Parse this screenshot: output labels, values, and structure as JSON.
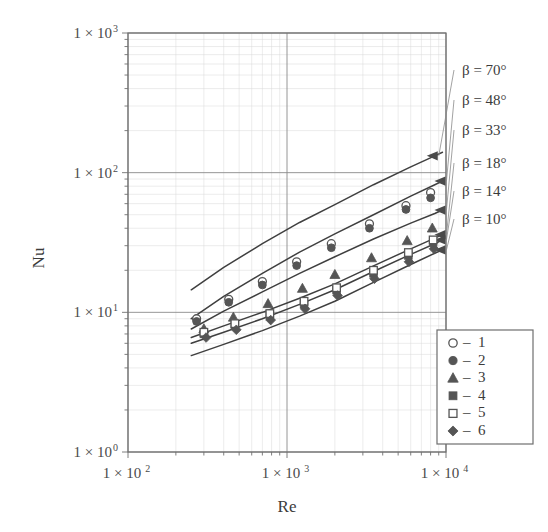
{
  "chart_data": {
    "type": "line",
    "title": "",
    "xlabel": "Re",
    "ylabel": "Nu",
    "xscale": "log",
    "yscale": "log",
    "xlim": [
      100,
      10000
    ],
    "ylim": [
      1,
      1000
    ],
    "grid": true,
    "x_tick_labels": [
      "1 × 10",
      "1 × 10",
      "1 × 10"
    ],
    "x_ticks": [
      {
        "value": 100,
        "mantissa": "1 × 10",
        "exponent": "2"
      },
      {
        "value": 1000,
        "mantissa": "1 × 10",
        "exponent": "3"
      },
      {
        "value": 10000,
        "mantissa": "1 × 10",
        "exponent": "4"
      }
    ],
    "y_ticks": [
      {
        "value": 1000,
        "mantissa": "1 × 10",
        "exponent": "3"
      },
      {
        "value": 100,
        "mantissa": "1 × 10",
        "exponent": "2"
      },
      {
        "value": 10,
        "mantissa": "1 × 10",
        "exponent": "1"
      },
      {
        "value": 1,
        "mantissa": "1 × 10",
        "exponent": "0"
      }
    ],
    "annotations": [
      {
        "label": "β = 70°",
        "beta": 70,
        "x": 462,
        "y": 75
      },
      {
        "label": "β = 48°",
        "beta": 48,
        "x": 462,
        "y": 105
      },
      {
        "label": "β = 33°",
        "beta": 33,
        "x": 462,
        "y": 135
      },
      {
        "label": "β = 18°",
        "beta": 18,
        "x": 462,
        "y": 168
      },
      {
        "label": "β = 14°",
        "beta": 14,
        "x": 462,
        "y": 196
      },
      {
        "label": "β = 10°",
        "beta": 10,
        "x": 462,
        "y": 224
      }
    ],
    "legend": {
      "position": "bottom-right",
      "entries": [
        {
          "marker": "open-circle",
          "dash": "–",
          "label": "1"
        },
        {
          "marker": "filled-circle",
          "dash": "–",
          "label": "2"
        },
        {
          "marker": "filled-triangle",
          "dash": "–",
          "label": "3"
        },
        {
          "marker": "filled-square",
          "dash": "–",
          "label": "4"
        },
        {
          "marker": "open-square",
          "dash": "–",
          "label": "5"
        },
        {
          "marker": "filled-diamond",
          "dash": "–",
          "label": "6"
        }
      ]
    },
    "curves": [
      {
        "name": "beta-70",
        "beta": 70,
        "points": [
          [
            250,
            14.5
          ],
          [
            400,
            21
          ],
          [
            700,
            31
          ],
          [
            1200,
            44
          ],
          [
            2000,
            59
          ],
          [
            3500,
            82
          ],
          [
            6000,
            110
          ],
          [
            8500,
            132
          ],
          [
            9500,
            140
          ]
        ]
      },
      {
        "name": "beta-48",
        "beta": 48,
        "points": [
          [
            250,
            9.0
          ],
          [
            400,
            13.0
          ],
          [
            700,
            19.0
          ],
          [
            1200,
            27.0
          ],
          [
            2000,
            36.5
          ],
          [
            3500,
            50
          ],
          [
            6000,
            68
          ],
          [
            8500,
            82
          ],
          [
            9500,
            87
          ]
        ]
      },
      {
        "name": "beta-33",
        "beta": 33,
        "points": [
          [
            250,
            7.6
          ],
          [
            400,
            10.2
          ],
          [
            700,
            14.0
          ],
          [
            1200,
            19.0
          ],
          [
            2000,
            25.0
          ],
          [
            3500,
            33.5
          ],
          [
            6000,
            43.5
          ],
          [
            8500,
            51
          ],
          [
            9500,
            54
          ]
        ]
      },
      {
        "name": "beta-18",
        "beta": 18,
        "points": [
          [
            250,
            6.6
          ],
          [
            400,
            8.0
          ],
          [
            700,
            10.0
          ],
          [
            1200,
            12.6
          ],
          [
            2000,
            16.0
          ],
          [
            3500,
            21.5
          ],
          [
            6000,
            28.5
          ],
          [
            8500,
            34
          ],
          [
            9500,
            36
          ]
        ]
      },
      {
        "name": "beta-14",
        "beta": 14,
        "points": [
          [
            250,
            6.0
          ],
          [
            400,
            7.2
          ],
          [
            700,
            9.0
          ],
          [
            1200,
            11.4
          ],
          [
            2000,
            14.5
          ],
          [
            3500,
            19.6
          ],
          [
            6000,
            26.0
          ],
          [
            8500,
            31
          ],
          [
            9500,
            33
          ]
        ]
      },
      {
        "name": "beta-10",
        "beta": 10,
        "points": [
          [
            250,
            4.9
          ],
          [
            400,
            5.9
          ],
          [
            700,
            7.4
          ],
          [
            1200,
            9.4
          ],
          [
            2000,
            12.0
          ],
          [
            3500,
            16.4
          ],
          [
            6000,
            22.0
          ],
          [
            8500,
            26.5
          ],
          [
            9500,
            28
          ]
        ]
      }
    ],
    "series": [
      {
        "name": "1",
        "marker": "open-circle",
        "points": [
          [
            270,
            9.0
          ],
          [
            430,
            12.4
          ],
          [
            700,
            16.6
          ],
          [
            1150,
            23.0
          ],
          [
            1900,
            31.0
          ],
          [
            3300,
            43.0
          ],
          [
            5600,
            58.0
          ],
          [
            8000,
            72.0
          ]
        ]
      },
      {
        "name": "2",
        "marker": "filled-circle",
        "points": [
          [
            270,
            8.6
          ],
          [
            430,
            11.8
          ],
          [
            700,
            15.7
          ],
          [
            1150,
            21.6
          ],
          [
            1900,
            29.0
          ],
          [
            3300,
            40.0
          ],
          [
            5600,
            54.5
          ],
          [
            8000,
            66.0
          ]
        ]
      },
      {
        "name": "3",
        "marker": "filled-triangle",
        "points": [
          [
            300,
            7.6
          ],
          [
            460,
            9.2
          ],
          [
            760,
            11.5
          ],
          [
            1250,
            14.8
          ],
          [
            2000,
            18.6
          ],
          [
            3400,
            24.5
          ],
          [
            5700,
            32.5
          ],
          [
            8200,
            40.0
          ]
        ]
      },
      {
        "name": "4",
        "marker": "filled-square",
        "points": [
          [
            300,
            7.0
          ],
          [
            470,
            8.0
          ],
          [
            780,
            9.4
          ],
          [
            1280,
            11.5
          ],
          [
            2050,
            14.4
          ],
          [
            3500,
            19.0
          ],
          [
            5800,
            25.5
          ],
          [
            8300,
            31.5
          ]
        ]
      },
      {
        "name": "5",
        "marker": "open-square",
        "points": [
          [
            300,
            7.2
          ],
          [
            470,
            8.3
          ],
          [
            780,
            9.8
          ],
          [
            1280,
            12.0
          ],
          [
            2050,
            15.0
          ],
          [
            3500,
            20.0
          ],
          [
            5800,
            26.8
          ],
          [
            8300,
            33.0
          ]
        ]
      },
      {
        "name": "6",
        "marker": "filled-diamond",
        "points": [
          [
            310,
            6.6
          ],
          [
            480,
            7.5
          ],
          [
            790,
            8.8
          ],
          [
            1300,
            10.6
          ],
          [
            2080,
            13.2
          ],
          [
            3550,
            17.4
          ],
          [
            5850,
            23.0
          ],
          [
            8400,
            28.5
          ]
        ]
      }
    ]
  },
  "axes": {
    "y_title": "Nu",
    "x_title": "Re"
  },
  "colors": {
    "curve": "#3f3f3f",
    "marker": "#555555",
    "grid_major": "#8a8a8a",
    "grid_minor": "#d9d9d9",
    "frame": "#707070",
    "text": "#3b3b3b",
    "background": "#ffffff"
  }
}
